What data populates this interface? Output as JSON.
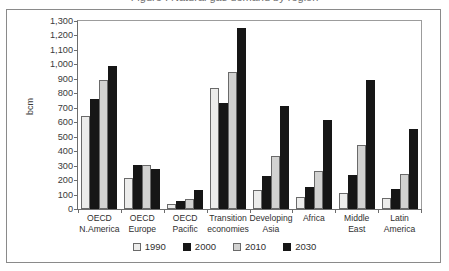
{
  "figure": {
    "clipped_title": "Figure : Natural gas demand by region",
    "frame_color": "#8a8a8a"
  },
  "chart_data": {
    "type": "bar",
    "title": "",
    "xlabel": "",
    "ylabel": "bcm",
    "ylim": [
      0,
      1300
    ],
    "ytick_step": 100,
    "grid": false,
    "legend_position": "bottom",
    "categories": [
      "OECD N.America",
      "OECD Europe",
      "OECD Pacific",
      "Transition economies",
      "Developing Asia",
      "Africa",
      "Middle East",
      "Latin America"
    ],
    "category_lines": [
      [
        "OECD",
        "N.America"
      ],
      [
        "OECD",
        "Europe"
      ],
      [
        "OECD",
        "Pacific"
      ],
      [
        "Transition",
        "economies"
      ],
      [
        "Developing",
        "Asia"
      ],
      [
        "Africa",
        ""
      ],
      [
        "Middle",
        "East"
      ],
      [
        "Latin",
        "America"
      ]
    ],
    "ytick_labels": [
      "0",
      "100",
      "200",
      "300",
      "400",
      "500",
      "600",
      "700",
      "800",
      "900",
      "1,000",
      "1,100",
      "1,200",
      "1,300"
    ],
    "ytick_values": [
      0,
      100,
      200,
      300,
      400,
      500,
      600,
      700,
      800,
      900,
      1000,
      1100,
      1200,
      1300
    ],
    "series": [
      {
        "name": "1990",
        "color": "#ececeb",
        "values": [
          645,
          215,
          35,
          840,
          132,
          85,
          113,
          78
        ]
      },
      {
        "name": "2000",
        "color": "#161616",
        "values": [
          760,
          307,
          52,
          735,
          230,
          155,
          233,
          138
        ]
      },
      {
        "name": "2010",
        "color": "#d2d2d1",
        "values": [
          890,
          303,
          72,
          945,
          368,
          265,
          443,
          243
        ]
      },
      {
        "name": "2030",
        "color": "#161616",
        "values": [
          990,
          278,
          132,
          1255,
          713,
          615,
          890,
          555
        ]
      }
    ]
  }
}
